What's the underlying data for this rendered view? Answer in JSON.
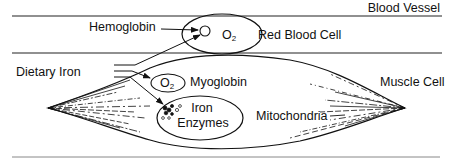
{
  "diagram": {
    "colors": {
      "ink": "#111111",
      "rule": "#888888",
      "background": "#ffffff"
    },
    "labels": {
      "blood_vessel": "Blood Vessel",
      "hemoglobin": "Hemoglobin",
      "red_blood_cell": "Red Blood Cell",
      "rbc_o2": "O",
      "rbc_o2_sub": "2",
      "dietary_iron": "Dietary Iron",
      "myoglobin": "Myoglobin",
      "myoglobin_o2": "O",
      "myoglobin_o2_sub": "2",
      "iron_enzymes_line1": "Iron",
      "iron_enzymes_line2": "Enzymes",
      "mitochondria": "Mitochondria",
      "muscle_cell": "Muscle Cell"
    },
    "flows": [
      {
        "from": "dietary_iron",
        "to": "hemoglobin"
      },
      {
        "from": "dietary_iron",
        "to": "myoglobin"
      },
      {
        "from": "dietary_iron",
        "to": "iron_enzymes"
      }
    ]
  }
}
